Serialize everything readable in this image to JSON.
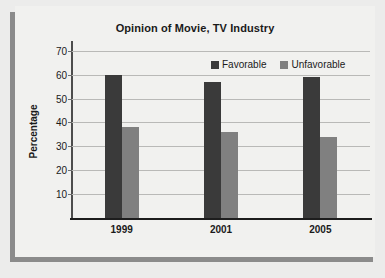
{
  "chart_data": {
    "type": "bar",
    "title": "Opinion of Movie, TV Industry",
    "xlabel": "",
    "ylabel": "Percentage",
    "categories": [
      "1999",
      "2001",
      "2005"
    ],
    "series": [
      {
        "name": "Favorable",
        "color": "#3a3a3a",
        "values": [
          60,
          57,
          59
        ]
      },
      {
        "name": "Unfavorable",
        "color": "#808080",
        "values": [
          38,
          36,
          34
        ]
      }
    ],
    "ylim": [
      0,
      72
    ],
    "yticks": [
      10,
      20,
      30,
      40,
      50,
      60,
      70
    ],
    "ytick_labels": [
      "10",
      "20",
      "30",
      "40",
      "50",
      "60",
      "70"
    ],
    "grid": true,
    "legend_position": "top-right"
  },
  "colors": {
    "background": "#ececeb",
    "panel": "#f1f1ef",
    "shadow": "#8b8b8b",
    "gridline": "#b9b9b7",
    "axis": "#1d1d1d",
    "text": "#1a1a1a"
  }
}
